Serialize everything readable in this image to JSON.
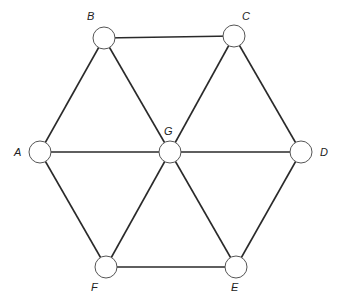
{
  "diagram": {
    "type": "hexagonal-wheel-graph",
    "nodes": [
      {
        "id": "A",
        "label": "A"
      },
      {
        "id": "B",
        "label": "B"
      },
      {
        "id": "C",
        "label": "C"
      },
      {
        "id": "D",
        "label": "D"
      },
      {
        "id": "E",
        "label": "E"
      },
      {
        "id": "F",
        "label": "F"
      },
      {
        "id": "G",
        "label": "G"
      }
    ],
    "edges": [
      [
        "A",
        "B"
      ],
      [
        "B",
        "C"
      ],
      [
        "C",
        "D"
      ],
      [
        "D",
        "E"
      ],
      [
        "E",
        "F"
      ],
      [
        "F",
        "A"
      ],
      [
        "G",
        "A"
      ],
      [
        "G",
        "B"
      ],
      [
        "G",
        "C"
      ],
      [
        "G",
        "D"
      ],
      [
        "G",
        "E"
      ],
      [
        "G",
        "F"
      ]
    ]
  }
}
